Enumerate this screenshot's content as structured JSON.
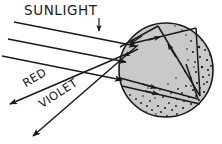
{
  "diagram": {
    "background_color": "#ffffff",
    "ink_color": "#1a1a1a",
    "labels": {
      "sunlight": "SUNLIGHT",
      "red": "RED",
      "violet": "VIOLET"
    },
    "raindrop": {
      "name": "raindrop-sphere",
      "fill_color": "#c9c9c9",
      "outline_color": "#1a1a1a",
      "center_x": 166,
      "center_y": 70,
      "radius": 48,
      "stipple_color": "#1a1a1a",
      "stipple_description": "dense dark speckles along right and bottom inner crescent"
    },
    "rays": {
      "incoming_count": 3,
      "incoming_description": "three parallel sunlight rays descending to the right at about 30 degrees",
      "outgoing_count": 2,
      "outgoing_description": "two dispersed rays exiting to the lower left, labelled RED and VIOLET",
      "internal_description": "refraction at entry, total internal reflection at back surface, refraction at exit"
    }
  }
}
